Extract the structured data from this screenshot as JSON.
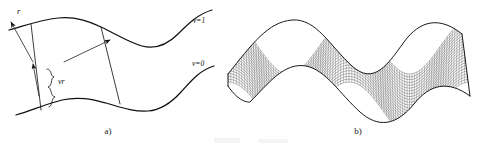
{
  "figure": {
    "panels": [
      {
        "id": "a",
        "caption": "a)",
        "labels": {
          "vector_r": "r",
          "offset_vr": "vr",
          "iso_top": "v=1",
          "iso_bottom": "v=0"
        }
      },
      {
        "id": "b",
        "caption": "b)"
      }
    ],
    "colors": {
      "ink": "#111111",
      "mesh": "#2b2b2b",
      "background": "#ffffff"
    }
  },
  "chart_data": {
    "type": "line",
    "title": "",
    "xlabel": "",
    "ylabel": "",
    "panel_a": {
      "description": "Ruled surface patch bounded by two sinusoidal isoparametric curves",
      "iso_curves": [
        {
          "name": "v=1",
          "label": "v=1"
        },
        {
          "name": "v=0",
          "label": "v=0"
        }
      ],
      "annotations": [
        {
          "name": "r",
          "label": "r"
        },
        {
          "name": "vr",
          "label": "vr"
        }
      ]
    },
    "panel_b": {
      "description": "Wireframe mesh of a sinusoidal ruled surface with two crests",
      "u_lines": 96,
      "v_lines": 22,
      "periods": 2
    }
  }
}
